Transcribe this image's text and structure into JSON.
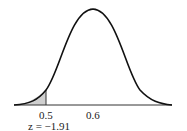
{
  "figure": {
    "type": "normal-distribution-curve",
    "mean_label": "0.6",
    "cutoff_label": "0.5",
    "z_label": "z = −1.91",
    "shaded_region": "left tail below 0.5",
    "colors": {
      "curve": "#111111",
      "shade": "#cfcfcf",
      "axis": "#333333"
    }
  }
}
